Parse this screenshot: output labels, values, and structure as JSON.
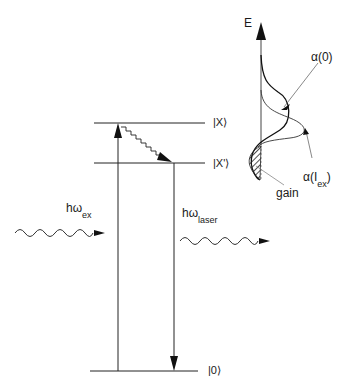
{
  "levels": {
    "X": "|X⟩",
    "Xprime": "|X'⟩",
    "zero": "|0⟩"
  },
  "photons": {
    "excitation": {
      "symbol": "hω",
      "subscript": "ex"
    },
    "laser": {
      "symbol": "hω",
      "subscript": "laser"
    }
  },
  "spectrum": {
    "axis_label": "E",
    "alpha0_label": "α(0)",
    "alphaIex_label": "α(I",
    "alphaIex_sub": "ex",
    "alphaIex_close": ")",
    "gain_label": "gain"
  }
}
